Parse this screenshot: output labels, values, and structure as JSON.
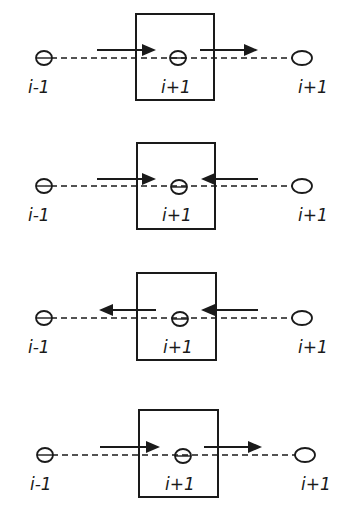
{
  "diagram": {
    "stroke_color": "#1a1a1a",
    "background": "#ffffff",
    "panels": [
      {
        "box": {
          "x": 136,
          "y": 14,
          "w": 78,
          "h": 86
        },
        "line_y": 58,
        "arrow_y": 50,
        "nodes": [
          {
            "cx": 44,
            "cy": 58,
            "label": "i-1",
            "lx": 28,
            "ly": 93
          },
          {
            "cx": 178,
            "cy": 58,
            "label": "i+1",
            "lx": 161,
            "ly": 93
          },
          {
            "cx": 302,
            "cy": 58,
            "label": "i+1",
            "lx": 298,
            "ly": 93
          }
        ],
        "arrows": [
          {
            "from": 97,
            "to": 156,
            "direction": "right"
          },
          {
            "from": 200,
            "to": 258,
            "direction": "right"
          }
        ]
      },
      {
        "box": {
          "x": 137,
          "y": 143,
          "w": 78,
          "h": 86
        },
        "line_y": 186,
        "arrow_y": 179,
        "nodes": [
          {
            "cx": 44,
            "cy": 186,
            "label": "i-1",
            "lx": 28,
            "ly": 221
          },
          {
            "cx": 179,
            "cy": 187,
            "label": "i+1",
            "lx": 162,
            "ly": 221
          },
          {
            "cx": 302,
            "cy": 186,
            "label": "i+1",
            "lx": 298,
            "ly": 221
          }
        ],
        "arrows": [
          {
            "from": 97,
            "to": 156,
            "direction": "right"
          },
          {
            "from": 258,
            "to": 201,
            "direction": "left"
          }
        ]
      },
      {
        "box": {
          "x": 137,
          "y": 273,
          "w": 79,
          "h": 87
        },
        "line_y": 318,
        "arrow_y": 310,
        "nodes": [
          {
            "cx": 44,
            "cy": 318,
            "label": "i-1",
            "lx": 28,
            "ly": 353
          },
          {
            "cx": 180,
            "cy": 319,
            "label": "i+1",
            "lx": 163,
            "ly": 353
          },
          {
            "cx": 302,
            "cy": 318,
            "label": "i+1",
            "lx": 298,
            "ly": 353
          }
        ],
        "arrows": [
          {
            "from": 156,
            "to": 99,
            "direction": "left"
          },
          {
            "from": 258,
            "to": 201,
            "direction": "left"
          }
        ]
      },
      {
        "box": {
          "x": 139,
          "y": 410,
          "w": 79,
          "h": 87
        },
        "line_y": 455,
        "arrow_y": 447,
        "nodes": [
          {
            "cx": 45,
            "cy": 455,
            "label": "i-1",
            "lx": 30,
            "ly": 490
          },
          {
            "cx": 183,
            "cy": 456,
            "label": "i+1",
            "lx": 165,
            "ly": 490
          },
          {
            "cx": 305,
            "cy": 455,
            "label": "i+1",
            "lx": 301,
            "ly": 490
          }
        ],
        "arrows": [
          {
            "from": 100,
            "to": 160,
            "direction": "right"
          },
          {
            "from": 204,
            "to": 262,
            "direction": "right"
          }
        ]
      }
    ]
  }
}
